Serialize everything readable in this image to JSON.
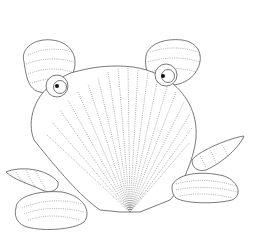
{
  "image": {
    "subject": "seashell-crab-line-drawing",
    "style": "coloring-page",
    "background_color": "#ffffff",
    "line_color": "#555555"
  }
}
